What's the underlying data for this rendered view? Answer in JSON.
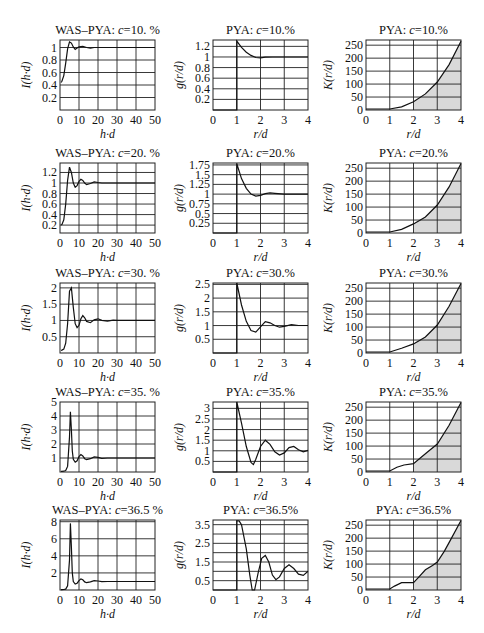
{
  "chart_data": [
    {
      "type": "line",
      "row": 0,
      "col": 0,
      "title": "WAS–PYA: c=10. %",
      "title_prefix": "WAS–PYA: ",
      "title_var": "c",
      "title_val": "=10. %",
      "xlabel": "h·d",
      "ylabel": "I(h·d)",
      "xlim": [
        0,
        50
      ],
      "ylim": [
        0,
        1.12
      ],
      "xticks": [
        0,
        10,
        20,
        30,
        40,
        50
      ],
      "yticks": [
        0.2,
        0.4,
        0.6,
        0.8,
        1
      ],
      "ytick_labels": [
        "0.2",
        "0.4",
        "0.6",
        "0.8",
        "1"
      ],
      "x": [
        0.5,
        1,
        2,
        3,
        4,
        5,
        6,
        7,
        8,
        9,
        10,
        12,
        14,
        16,
        18,
        20,
        25,
        30,
        40,
        50
      ],
      "y": [
        0.44,
        0.46,
        0.55,
        0.75,
        0.98,
        1.09,
        1.07,
        1.01,
        0.97,
        0.99,
        1.01,
        1.02,
        1.0,
        0.99,
        1.0,
        1.0,
        1.0,
        1.0,
        1.0,
        1.0
      ]
    },
    {
      "type": "line",
      "row": 0,
      "col": 1,
      "title": "PYA: c=10.%",
      "title_prefix": "PYA: ",
      "title_var": "c",
      "title_val": "=10.%",
      "xlabel": "r/d",
      "ylabel": "g(r/d)",
      "xlim": [
        0,
        4
      ],
      "ylim": [
        0,
        1.32
      ],
      "xticks": [
        0,
        1,
        2,
        3,
        4
      ],
      "yticks": [
        0.2,
        0.4,
        0.6,
        0.8,
        1,
        1.2
      ],
      "ytick_labels": [
        "0.2",
        "0.4",
        "0.6",
        "0.8",
        "1",
        "1.2"
      ],
      "x": [
        0,
        1,
        1,
        1.2,
        1.4,
        1.6,
        1.8,
        2.0,
        2.2,
        2.5,
        3,
        3.5,
        4
      ],
      "y": [
        0,
        0,
        1.3,
        1.18,
        1.09,
        1.03,
        0.99,
        0.985,
        0.995,
        1.0,
        1.0,
        1.0,
        1.0
      ]
    },
    {
      "type": "area",
      "row": 0,
      "col": 2,
      "title": "PYA: c=10.%",
      "title_prefix": "PYA: ",
      "title_var": "c",
      "title_val": "=10.%",
      "xlabel": "r/d",
      "ylabel": "K(r/d)",
      "xlim": [
        0,
        4
      ],
      "ylim": [
        0,
        270
      ],
      "xticks": [
        0,
        1,
        2,
        3,
        4
      ],
      "yticks": [
        0,
        50,
        100,
        150,
        200,
        250
      ],
      "ytick_labels": [
        "0",
        "50",
        "100",
        "150",
        "200",
        "250"
      ],
      "shade_from": 2,
      "x": [
        0,
        1,
        1.5,
        2,
        2.5,
        3,
        3.5,
        4
      ],
      "y": [
        4,
        4,
        12,
        32,
        62,
        108,
        175,
        265
      ]
    },
    {
      "type": "line",
      "row": 1,
      "col": 0,
      "title": "WAS–PYA: c=20. %",
      "title_prefix": "WAS–PYA: ",
      "title_var": "c",
      "title_val": "=20. %",
      "xlabel": "h·d",
      "ylabel": "I(h·d)",
      "xlim": [
        0,
        50
      ],
      "ylim": [
        0.05,
        1.38
      ],
      "xticks": [
        0,
        10,
        20,
        30,
        40,
        50
      ],
      "yticks": [
        0.2,
        0.4,
        0.6,
        0.8,
        1,
        1.2
      ],
      "ytick_labels": [
        "0.2",
        "0.4",
        "0.6",
        "0.8",
        "1",
        "1.2"
      ],
      "x": [
        0.5,
        1,
        2,
        3,
        4,
        5,
        6,
        7,
        8,
        9,
        10,
        11,
        12,
        13,
        14,
        16,
        18,
        20,
        22,
        25,
        30,
        40,
        50
      ],
      "y": [
        0.2,
        0.21,
        0.3,
        0.6,
        1.05,
        1.3,
        1.2,
        1.0,
        0.92,
        0.95,
        1.03,
        1.07,
        1.05,
        1.0,
        0.97,
        0.99,
        1.02,
        1.01,
        1.0,
        1.0,
        1.0,
        1.0,
        1.0
      ]
    },
    {
      "type": "line",
      "row": 1,
      "col": 1,
      "title": "PYA: c=20.%",
      "title_prefix": "PYA: ",
      "title_var": "c",
      "title_val": "=20.%",
      "xlabel": "r/d",
      "ylabel": "g(r/d)",
      "xlim": [
        0,
        4
      ],
      "ylim": [
        0,
        1.8
      ],
      "xticks": [
        0,
        1,
        2,
        3,
        4
      ],
      "yticks": [
        0.25,
        0.5,
        0.75,
        1,
        1.25,
        1.5,
        1.75
      ],
      "ytick_labels": [
        "0.25",
        "0.5",
        "0.75",
        "1",
        "1.25",
        "1.5",
        "1.75"
      ],
      "x": [
        0,
        1,
        1,
        1.2,
        1.4,
        1.6,
        1.8,
        2.0,
        2.2,
        2.4,
        2.6,
        3,
        3.5,
        4
      ],
      "y": [
        0,
        0,
        1.78,
        1.4,
        1.15,
        1.0,
        0.95,
        0.97,
        1.01,
        1.03,
        1.02,
        1.0,
        1.0,
        1.0
      ]
    },
    {
      "type": "area",
      "row": 1,
      "col": 2,
      "title": "PYA: c=20.%",
      "title_prefix": "PYA: ",
      "title_var": "c",
      "title_val": "=20.%",
      "xlabel": "r/d",
      "ylabel": "K(r/d)",
      "xlim": [
        0,
        4
      ],
      "ylim": [
        0,
        270
      ],
      "xticks": [
        0,
        1,
        2,
        3,
        4
      ],
      "yticks": [
        0,
        50,
        100,
        150,
        200,
        250
      ],
      "ytick_labels": [
        "0",
        "50",
        "100",
        "150",
        "200",
        "250"
      ],
      "shade_from": 2,
      "x": [
        0,
        1,
        1.5,
        2,
        2.5,
        3,
        3.5,
        4
      ],
      "y": [
        4,
        4,
        14,
        35,
        62,
        108,
        178,
        268
      ]
    },
    {
      "type": "line",
      "row": 2,
      "col": 0,
      "title": "WAS–PYA: c=30. %",
      "title_prefix": "WAS–PYA: ",
      "title_var": "c",
      "title_val": "=30. %",
      "xlabel": "h·d",
      "ylabel": "I(h·d)",
      "xlim": [
        0,
        50
      ],
      "ylim": [
        0,
        2.15
      ],
      "xticks": [
        0,
        10,
        20,
        30,
        40,
        50
      ],
      "yticks": [
        0.5,
        1,
        1.5,
        2
      ],
      "ytick_labels": [
        "0.5",
        "1",
        "1.5",
        "2"
      ],
      "x": [
        0.5,
        1,
        2,
        3,
        4,
        5,
        6,
        7,
        8,
        9,
        10,
        11,
        12,
        13,
        14,
        16,
        18,
        20,
        22,
        25,
        28,
        30,
        40,
        50
      ],
      "y": [
        0.08,
        0.09,
        0.12,
        0.3,
        0.9,
        1.9,
        2.0,
        1.4,
        0.9,
        0.78,
        0.85,
        1.05,
        1.15,
        1.08,
        0.97,
        0.93,
        1.02,
        1.05,
        1.0,
        0.98,
        1.01,
        1.0,
        1.0,
        1.0
      ]
    },
    {
      "type": "line",
      "row": 2,
      "col": 1,
      "title": "PYA: c=30.%",
      "title_prefix": "PYA: ",
      "title_var": "c",
      "title_val": "=30.%",
      "xlabel": "r/d",
      "ylabel": "g(r/d)",
      "xlim": [
        0,
        4
      ],
      "ylim": [
        0,
        2.55
      ],
      "xticks": [
        0,
        1,
        2,
        3,
        4
      ],
      "yticks": [
        0.5,
        1,
        1.5,
        2,
        2.5
      ],
      "ytick_labels": [
        "0.5",
        "1",
        "1.5",
        "2",
        "2.5"
      ],
      "x": [
        0,
        1,
        1,
        1.2,
        1.4,
        1.6,
        1.8,
        2.0,
        2.2,
        2.4,
        2.6,
        2.8,
        3.0,
        3.3,
        3.6,
        4
      ],
      "y": [
        0,
        0,
        2.55,
        1.75,
        1.15,
        0.82,
        0.76,
        0.95,
        1.14,
        1.1,
        1.0,
        0.94,
        0.97,
        1.03,
        1.0,
        1.0
      ]
    },
    {
      "type": "area",
      "row": 2,
      "col": 2,
      "title": "PYA: c=30.%",
      "title_prefix": "PYA: ",
      "title_var": "c",
      "title_val": "=30.%",
      "xlabel": "r/d",
      "ylabel": "K(r/d)",
      "xlim": [
        0,
        4
      ],
      "ylim": [
        0,
        270
      ],
      "xticks": [
        0,
        1,
        2,
        3,
        4
      ],
      "yticks": [
        0,
        50,
        100,
        150,
        200,
        250
      ],
      "ytick_labels": [
        "0",
        "50",
        "100",
        "150",
        "200",
        "250"
      ],
      "shade_from": 2,
      "x": [
        0,
        1,
        1.5,
        2,
        2.5,
        3,
        3.5,
        4
      ],
      "y": [
        4,
        4,
        18,
        35,
        62,
        108,
        180,
        268
      ]
    },
    {
      "type": "line",
      "row": 3,
      "col": 0,
      "title": "WAS–PYA: c=35. %",
      "title_prefix": "WAS–PYA: ",
      "title_var": "c",
      "title_val": "=35. %",
      "xlabel": "h·d",
      "ylabel": "I(h·d)",
      "xlim": [
        0,
        50
      ],
      "ylim": [
        0,
        5
      ],
      "xticks": [
        0,
        10,
        20,
        30,
        40,
        50
      ],
      "yticks": [
        1,
        2,
        3,
        4,
        5
      ],
      "ytick_labels": [
        "1",
        "2",
        "3",
        "4",
        "5"
      ],
      "x": [
        0.5,
        1,
        2,
        3,
        4,
        5,
        5.5,
        6,
        6.5,
        7,
        8,
        9,
        10,
        11,
        12,
        13,
        14,
        16,
        18,
        20,
        22,
        25,
        30,
        40,
        50
      ],
      "y": [
        0.05,
        0.05,
        0.06,
        0.1,
        0.4,
        2.5,
        4.3,
        3.0,
        1.5,
        0.9,
        0.7,
        0.8,
        1.1,
        1.25,
        1.15,
        0.95,
        0.88,
        0.95,
        1.08,
        1.05,
        0.98,
        1.0,
        1.0,
        1.0,
        1.0
      ]
    },
    {
      "type": "line",
      "row": 3,
      "col": 1,
      "title": "PYA: c=35.%",
      "title_prefix": "PYA: ",
      "title_var": "c",
      "title_val": "=35.%",
      "xlabel": "r/d",
      "ylabel": "g(r/d)",
      "xlim": [
        0,
        4
      ],
      "ylim": [
        0,
        3.3
      ],
      "xticks": [
        0,
        1,
        2,
        3,
        4
      ],
      "yticks": [
        0.5,
        1,
        1.5,
        2,
        2.5,
        3
      ],
      "ytick_labels": [
        "0.5",
        "1",
        "1.5",
        "2",
        "2.5",
        "3"
      ],
      "x": [
        0,
        1,
        1,
        1.2,
        1.4,
        1.6,
        1.7,
        1.8,
        2.0,
        2.2,
        2.4,
        2.6,
        2.8,
        3.0,
        3.2,
        3.4,
        3.6,
        3.8,
        4
      ],
      "y": [
        0,
        0,
        3.3,
        2.3,
        1.2,
        0.45,
        0.35,
        0.6,
        1.2,
        1.5,
        1.3,
        0.95,
        0.8,
        0.9,
        1.15,
        1.2,
        1.05,
        0.95,
        1.02
      ]
    },
    {
      "type": "area",
      "row": 3,
      "col": 2,
      "title": "PYA: c=35.%",
      "title_prefix": "PYA: ",
      "title_var": "c",
      "title_val": "=35.%",
      "xlabel": "r/d",
      "ylabel": "K(r/d)",
      "xlim": [
        0,
        4
      ],
      "ylim": [
        0,
        270
      ],
      "xticks": [
        0,
        1,
        2,
        3,
        4
      ],
      "yticks": [
        0,
        50,
        100,
        150,
        200,
        250
      ],
      "ytick_labels": [
        "0",
        "50",
        "100",
        "150",
        "200",
        "250"
      ],
      "shade_from": 2,
      "x": [
        0,
        1,
        1.3,
        1.6,
        2,
        2.3,
        2.6,
        3,
        3.5,
        4
      ],
      "y": [
        4,
        4,
        18,
        27,
        32,
        55,
        78,
        108,
        180,
        268
      ]
    },
    {
      "type": "line",
      "row": 4,
      "col": 0,
      "title": "WAS–PYA: c=36.5 %",
      "title_prefix": "WAS–PYA: ",
      "title_var": "c",
      "title_val": "=36.5 %",
      "xlabel": "h·d",
      "ylabel": "I(h·d)",
      "xlim": [
        0,
        50
      ],
      "ylim": [
        0,
        8.2
      ],
      "xticks": [
        0,
        10,
        20,
        30,
        40,
        50
      ],
      "yticks": [
        2,
        4,
        6,
        8
      ],
      "ytick_labels": [
        "2",
        "4",
        "6",
        "8"
      ],
      "x": [
        0.5,
        1,
        2,
        3,
        4,
        5,
        5.5,
        6,
        6.5,
        7,
        8,
        9,
        10,
        11,
        12,
        13,
        14,
        16,
        18,
        20,
        22,
        25,
        30,
        40,
        50
      ],
      "y": [
        0.05,
        0.05,
        0.06,
        0.1,
        0.5,
        3.5,
        7.8,
        5.0,
        2.0,
        1.0,
        0.7,
        0.8,
        1.1,
        1.3,
        1.2,
        0.95,
        0.85,
        0.95,
        1.1,
        1.05,
        0.98,
        1.0,
        1.0,
        1.0,
        1.0
      ]
    },
    {
      "type": "line",
      "row": 4,
      "col": 1,
      "title": "PYA: c=36.5%",
      "title_prefix": "PYA: ",
      "title_var": "c",
      "title_val": "=36.5%",
      "xlabel": "r/d",
      "ylabel": "g(r/d)",
      "xlim": [
        0,
        4
      ],
      "ylim": [
        0,
        3.75
      ],
      "xticks": [
        0,
        1,
        2,
        3,
        4
      ],
      "yticks": [
        0.5,
        1,
        1.5,
        2,
        2.5,
        3,
        3.5
      ],
      "ytick_labels": [
        "0.5",
        "",
        "1.5",
        "",
        "2.5",
        "",
        "3.5"
      ],
      "x": [
        0,
        1,
        1,
        1.1,
        1.2,
        1.4,
        1.55,
        1.65,
        1.75,
        1.9,
        2.05,
        2.2,
        2.35,
        2.5,
        2.65,
        2.8,
        3.0,
        3.2,
        3.4,
        3.6,
        3.8,
        4
      ],
      "y": [
        0,
        0,
        3.7,
        3.7,
        3.5,
        2.2,
        0.8,
        0.0,
        0.0,
        0.9,
        1.7,
        1.85,
        1.5,
        0.8,
        0.55,
        0.7,
        1.15,
        1.35,
        1.15,
        0.85,
        0.78,
        1.0
      ]
    },
    {
      "type": "area",
      "row": 4,
      "col": 2,
      "title": "PYA: c=36.5%",
      "title_prefix": "PYA: ",
      "title_var": "c",
      "title_val": "=36.5%",
      "xlabel": "r/d",
      "ylabel": "K(r/d)",
      "xlim": [
        0,
        4
      ],
      "ylim": [
        0,
        270
      ],
      "xticks": [
        0,
        1,
        2,
        3,
        4
      ],
      "yticks": [
        0,
        50,
        100,
        150,
        200,
        250
      ],
      "ytick_labels": [
        "0",
        "50",
        "100",
        "150",
        "200",
        "250"
      ],
      "shade_from": 2,
      "x": [
        0,
        1,
        1.2,
        1.5,
        1.8,
        2,
        2.2,
        2.5,
        2.8,
        3,
        3.3,
        3.6,
        4
      ],
      "y": [
        4,
        4,
        15,
        28,
        28,
        28,
        48,
        78,
        95,
        108,
        150,
        200,
        268
      ]
    }
  ],
  "layout": {
    "cols_x": [
      60,
      213,
      366
    ],
    "rows_y": [
      40,
      163,
      283,
      402,
      520
    ],
    "plot_w": 95,
    "plot_h": 70
  }
}
